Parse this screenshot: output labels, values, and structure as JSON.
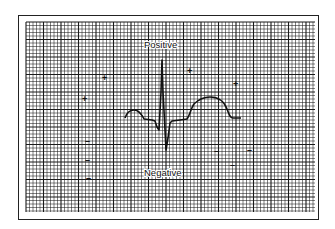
{
  "figure": {
    "labels": {
      "positive": "Positive",
      "negative": "Negative"
    },
    "markers": {
      "plus": [
        {
          "x": 85,
          "y": 99,
          "symbol": "+"
        },
        {
          "x": 105,
          "y": 78,
          "symbol": "+"
        },
        {
          "x": 190,
          "y": 71,
          "symbol": "+"
        },
        {
          "x": 236,
          "y": 84,
          "symbol": "+"
        }
      ],
      "minus": [
        {
          "x": 88,
          "y": 141,
          "symbol": "–"
        },
        {
          "x": 88,
          "y": 160,
          "symbol": "–"
        },
        {
          "x": 89,
          "y": 178,
          "symbol": "–"
        },
        {
          "x": 217,
          "y": 151,
          "symbol": "–"
        },
        {
          "x": 233,
          "y": 165,
          "symbol": "–"
        },
        {
          "x": 250,
          "y": 150,
          "symbol": "–"
        }
      ]
    },
    "grid": {
      "x0": 26,
      "y0": 22,
      "x1": 315,
      "y1": 212,
      "minor_spacing": 3.5,
      "major_every": 5,
      "line_color": "#1a1a1a"
    },
    "waveform": {
      "color": "#111111",
      "baseline_y": 118,
      "segments": [
        "P wave",
        "PR segment",
        "QRS complex",
        "ST segment",
        "T wave"
      ]
    }
  }
}
